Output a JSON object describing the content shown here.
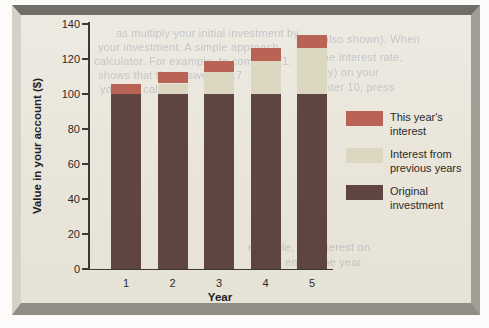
{
  "figure": {
    "panel_background": "#e9e5da",
    "page_background": "#fcfbf9",
    "axis_color": "#3a3936"
  },
  "chart_data": {
    "type": "bar",
    "stacked": true,
    "title": "",
    "xlabel": "Year",
    "ylabel": "Value in your account ($)",
    "ylim": [
      0,
      140
    ],
    "yticks": [
      0,
      20,
      40,
      60,
      80,
      100,
      120,
      140
    ],
    "grid": false,
    "legend_position": "right",
    "categories": [
      "1",
      "2",
      "3",
      "4",
      "5"
    ],
    "series": [
      {
        "name": "Original investment",
        "color": "#5e4542",
        "values": [
          100,
          100,
          100,
          100,
          100
        ]
      },
      {
        "name": "Interest from previous years",
        "color": "#dcd7c1",
        "values": [
          0,
          6.0,
          12.36,
          19.1,
          26.25
        ]
      },
      {
        "name": "This year's interest",
        "color": "#b96354",
        "values": [
          6.0,
          6.36,
          6.74,
          7.15,
          7.57
        ]
      }
    ],
    "stack_totals": [
      106.0,
      112.4,
      119.1,
      126.3,
      133.8
    ]
  },
  "legend": {
    "items": [
      {
        "line1": "This year's",
        "line2": "interest",
        "color": "#b96354"
      },
      {
        "line1": "Interest from",
        "line2": "previous years",
        "color": "#dcd7c1"
      },
      {
        "line1": "Original",
        "line2": "investment",
        "color": "#5e4542"
      }
    ]
  },
  "bleedthrough": [
    {
      "x": 116,
      "y": 27,
      "text": "as multiply your initial investment by"
    },
    {
      "x": 98,
      "y": 41,
      "text": "your investment. A simple approach"
    },
    {
      "x": 94,
      "y": 55,
      "text": "calculator. For example, to compute (1."
    },
    {
      "x": 98,
      "y": 69,
      "text": "shows that the answer is 1.7"
    },
    {
      "x": 100,
      "y": 83,
      "text": "you can calculate"
    },
    {
      "x": 296,
      "y": 33,
      "text": "rate (also shown). When"
    },
    {
      "x": 308,
      "y": 51,
      "text": "is the interest rate,"
    },
    {
      "x": 316,
      "y": 66,
      "text": "key) on your"
    },
    {
      "x": 318,
      "y": 81,
      "text": "enter 10, press"
    },
    {
      "x": 248,
      "y": 241,
      "text": "example, the interest on"
    },
    {
      "x": 253,
      "y": 256,
      "text": "at the end of the year"
    }
  ]
}
